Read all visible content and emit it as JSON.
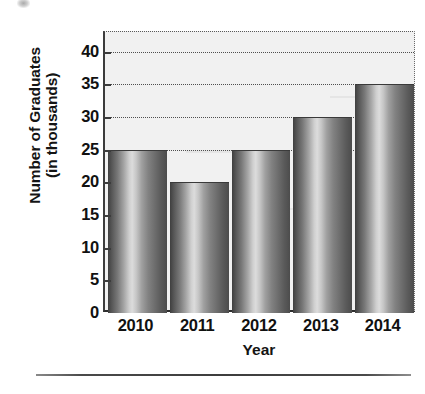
{
  "chart_data": {
    "type": "bar",
    "title": "",
    "categories": [
      "2010",
      "2011",
      "2012",
      "2013",
      "2014"
    ],
    "values": [
      25,
      20,
      25,
      30,
      35
    ],
    "series": [
      {
        "name": "Number of Graduates (in thousands)",
        "values": [
          25,
          20,
          25,
          30,
          35
        ]
      }
    ],
    "xlabel": "Year",
    "ylabel": "Number of Graduates (in thousands)",
    "ylabel_lines": [
      "Number of Graduates",
      "(in thousands)"
    ],
    "ylim": [
      0,
      43
    ],
    "yticks": [
      0,
      5,
      10,
      15,
      20,
      25,
      30,
      35,
      40
    ],
    "ytick_labels": [
      "0",
      "5",
      "10",
      "15",
      "20",
      "25",
      "30",
      "35",
      "40"
    ],
    "y_tick_interval": 5,
    "grid": true,
    "grid_axis": "y",
    "grid_style": "dotted",
    "legend": false,
    "legend_position": "none",
    "bar_style": "cylindrical-gradient-grayscale",
    "units": "thousands"
  },
  "axis": {
    "y_title_line1": "Number of Graduates",
    "y_title_line2": "(in thousands)",
    "x_title": "Year"
  },
  "colors": {
    "plot_background": "#f1f1f1",
    "axis_line": "#3c3c3c",
    "gridline": "#4f4f4f",
    "bar_dark": "#3f3f3f",
    "bar_highlight": "#dcdcdc",
    "text": "#111111",
    "rule": "#3d3d3d"
  }
}
